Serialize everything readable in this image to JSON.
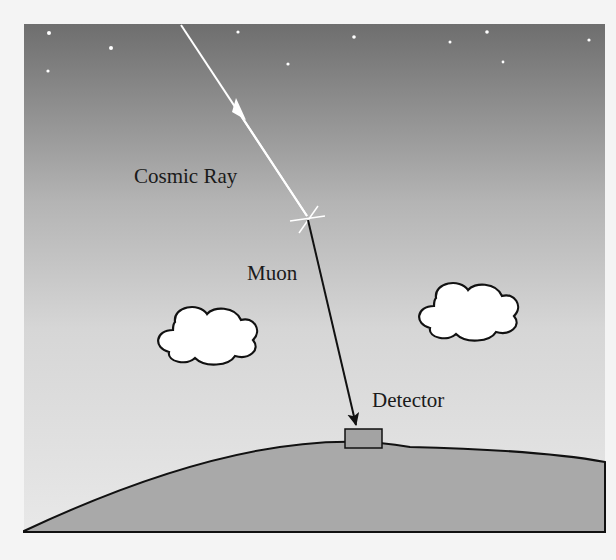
{
  "diagram": {
    "labels": {
      "cosmic_ray": "Cosmic Ray",
      "muon": "Muon",
      "detector": "Detector"
    },
    "colors": {
      "sky_top": "#707070",
      "sky_bottom": "#e6e6e6",
      "ground": "#a9a9a9",
      "detector": "#a0a0a0",
      "cosmic_ray": "#ffffff",
      "muon": "#111111",
      "cloud": "#ffffff"
    }
  }
}
